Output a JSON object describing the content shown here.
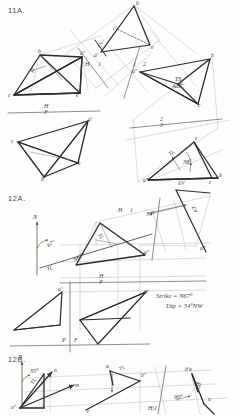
{
  "sheet": {
    "title": "Descriptive Geometry Worksheet",
    "ink_color": "#2b2b2b",
    "construction_color": "#8c8c8c",
    "paper_color": "#fdfdfc"
  },
  "problems": [
    {
      "id": "11A",
      "label": "11A.",
      "description": "Plane ABC - true shape by successive auxiliary views, with edge view and dihedral/dip angle",
      "fold_lines": [
        {
          "name": "H-F",
          "upper": "H",
          "lower": "F"
        },
        {
          "name": "H-1",
          "upper": "H",
          "lower": "1"
        },
        {
          "name": "1-2",
          "upper": "1",
          "lower": "2"
        },
        {
          "name": "2-3",
          "upper": "2",
          "lower": "3"
        }
      ],
      "annotations": [
        {
          "text": "EV",
          "meaning": "edge-view"
        },
        {
          "text": "TS",
          "meaning": "true-shape"
        },
        {
          "text": "ABC",
          "meaning": "plane-name"
        },
        {
          "text": "TL",
          "meaning": "true-length"
        },
        {
          "text": "38°",
          "meaning": "dip-angle"
        }
      ],
      "vertex_labels": [
        "a′",
        "b",
        "c′",
        "e",
        "a″",
        "b",
        "c",
        "e",
        "a′",
        "b",
        "c",
        "e",
        "a″",
        "b",
        "c",
        "e",
        "a‴",
        "b",
        "c",
        "e"
      ]
    },
    {
      "id": "12A",
      "label": "12A.",
      "description": "Strike and dip of a plane from top and front views",
      "fold_lines": [
        {
          "name": "H-1",
          "upper": "H",
          "lower": "1"
        },
        {
          "name": "H-F",
          "upper": "H",
          "lower": "F"
        },
        {
          "name": "P-F",
          "upper": "P",
          "lower": "F"
        }
      ],
      "annotations": [
        {
          "text": "N",
          "meaning": "north-arrow"
        },
        {
          "text": "67°",
          "meaning": "strike-bearing-angle"
        },
        {
          "text": "N67°",
          "meaning": "strike-line-label"
        },
        {
          "text": "34°",
          "meaning": "dip-angle"
        },
        {
          "text": "TL",
          "meaning": "true-length"
        },
        {
          "text": "EV",
          "meaning": "edge-view"
        }
      ],
      "results": {
        "strike": "Strike = N67°",
        "dip": "Dip = 34°NW"
      },
      "vertex_labels": [
        "a″",
        "a‴",
        "a′",
        "aᵖ"
      ]
    },
    {
      "id": "12B",
      "label": "12B.",
      "description": "Bearing and slope of line OM / ON using auxiliary view",
      "fold_lines": [
        {
          "name": "H-1",
          "upper": "H",
          "lower": "1"
        }
      ],
      "annotations": [
        {
          "text": "N",
          "meaning": "north-arrow"
        },
        {
          "text": "35°",
          "meaning": "bearing-angle"
        },
        {
          "text": "90°",
          "meaning": "right-angle"
        },
        {
          "text": "TL",
          "meaning": "true-length"
        },
        {
          "text": "EV",
          "meaning": "edge-view"
        }
      ],
      "vertex_labels": [
        "o″",
        "n",
        "m",
        "c",
        "b″",
        "b′o",
        "n",
        "a",
        "o"
      ]
    }
  ],
  "text_marks": {
    "p11a_label": "11A.",
    "p12a_label": "12A.",
    "p12b_label": "12B.",
    "ev_top": "EV",
    "ts_line1": "TS",
    "ts_line2": "ABC",
    "tl_right": "TL",
    "ev_bottom": "EV",
    "ang_38": "38°",
    "fold_h": "H",
    "fold_f": "F",
    "fold_1": "1",
    "fold_2": "2",
    "fold_3": "3",
    "fold_p": "P",
    "north": "N",
    "ang_67": "67°",
    "ang_34": "34°",
    "ang_35": "35°",
    "ang_90": "90°",
    "strike_line": "N67°",
    "result_strike": "Strike = N67°",
    "result_dip": "Dip = 34°NW",
    "tl_12a": "TL",
    "tl_12b_left": "TL",
    "tl_12b_mid": "TL",
    "tl_12b_right": "TL",
    "v_a1": "a′",
    "v_b1": "b",
    "v_c1": "c′",
    "v_e1": "e",
    "v_a2": "a″",
    "v_b2": "b",
    "v_c2": "c",
    "v_e2": "e",
    "v_a3": "a′",
    "v_b3": "b",
    "v_c3": "c",
    "v_e3": "e",
    "v_a4": "a″",
    "v_b4": "b",
    "v_c4": "c",
    "v_e4": "e",
    "v_a5": "a‴",
    "v_b5": "b",
    "v_c5": "c",
    "v_e5": "e",
    "v_o12b": "o″",
    "v_n12b": "n",
    "v_m12b": "m",
    "v_c12b": "c",
    "v_b12b": "b″",
    "v_bo12b": "b′o",
    "v_n2_12b": "n",
    "v_a12b": "a",
    "v_ap12a": "a″",
    "v_aq12a": "a‴",
    "v_ar12a": "a′",
    "v_as12a": "aᵖ"
  }
}
